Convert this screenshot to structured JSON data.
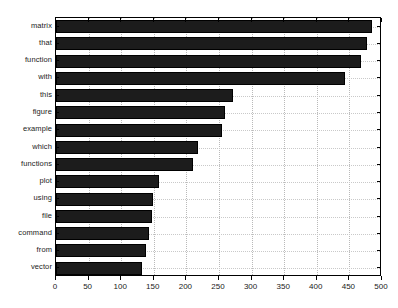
{
  "chart_data": {
    "type": "bar",
    "orientation": "horizontal",
    "title": "",
    "xlabel": "",
    "ylabel": "",
    "xlim": [
      0,
      500
    ],
    "ylim": [
      0,
      15
    ],
    "xticks": [
      0,
      50,
      100,
      150,
      200,
      250,
      300,
      350,
      400,
      450,
      500
    ],
    "grid": true,
    "legend": null,
    "bar_color": "#1c1c1c",
    "categories": [
      "matrix",
      "that",
      "function",
      "with",
      "this",
      "figure",
      "example",
      "which",
      "functions",
      "plot",
      "using",
      "file",
      "command",
      "from",
      "vector"
    ],
    "values": [
      485,
      477,
      468,
      443,
      272,
      259,
      255,
      218,
      210,
      158,
      149,
      147,
      143,
      138,
      132
    ]
  }
}
